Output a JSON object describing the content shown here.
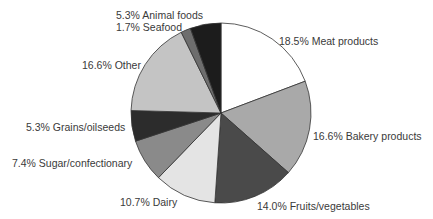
{
  "chart_data": {
    "type": "pie",
    "title": "",
    "start_angle_deg": 0,
    "direction": "clockwise",
    "unit": "%",
    "slices": [
      {
        "label": "Meat products",
        "value": 18.5,
        "display": "18.5% Meat products",
        "color": "#ffffff"
      },
      {
        "label": "Bakery products",
        "value": 16.6,
        "display": "16.6% Bakery products",
        "color": "#a9a9a9"
      },
      {
        "label": "Fruits/vegetables",
        "value": 14.0,
        "display": "14.0% Fruits/vegetables",
        "color": "#4a4a4a"
      },
      {
        "label": "Dairy",
        "value": 10.7,
        "display": "10.7% Dairy",
        "color": "#e4e4e4"
      },
      {
        "label": "Sugar/confectionary",
        "value": 7.4,
        "display": "7.4% Sugar/confectionary",
        "color": "#8a8a8a"
      },
      {
        "label": "Grains/oilseeds",
        "value": 5.3,
        "display": "5.3% Grains/oilseeds",
        "color": "#2c2c2c"
      },
      {
        "label": "Other",
        "value": 16.6,
        "display": "16.6% Other",
        "color": "#c4c4c4"
      },
      {
        "label": "Seafood",
        "value": 1.7,
        "display": "1.7% Seafood",
        "color": "#6e6e6e"
      },
      {
        "label": "Animal foods",
        "value": 5.3,
        "display": "5.3% Animal foods",
        "color": "#1c1c1c"
      }
    ],
    "legend": "none (direct labels)"
  },
  "labels": {
    "meat": "18.5% Meat products",
    "bakery": "16.6% Bakery products",
    "fruits": "14.0% Fruits/vegetables",
    "dairy": "10.7% Dairy",
    "sugar": "7.4% Sugar/confectionary",
    "grains": "5.3% Grains/oilseeds",
    "other": "16.6% Other",
    "seafood": "1.7% Seafood",
    "animal": "5.3% Animal foods"
  }
}
